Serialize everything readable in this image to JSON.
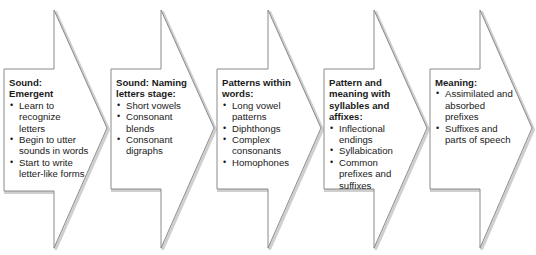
{
  "diagram": {
    "type": "chevron-process",
    "direction": "left-to-right",
    "colors": {
      "fill": "#ffffff",
      "stroke": "#8a8a8a",
      "shadow": "#c8c8c8",
      "text": "#1a1a1a"
    },
    "stages": [
      {
        "title": "Sound: Emergent",
        "title_lines": [
          "Sound:",
          "Emergent"
        ],
        "items": [
          "Learn to recognize letters",
          "Begin to utter sounds in words",
          "Start to write letter-like forms"
        ]
      },
      {
        "title": "Sound: Naming letters stage:",
        "title_lines": [
          "Sound: Naming",
          "letters stage:"
        ],
        "items": [
          "Short vowels",
          "Consonant blends",
          "Consonant digraphs"
        ]
      },
      {
        "title": "Patterns within words:",
        "title_lines": [
          "Patterns within",
          "words:"
        ],
        "items": [
          "Long vowel patterns",
          "Diphthongs",
          "Complex consonants",
          "Homophones"
        ]
      },
      {
        "title": "Pattern and meaning with syllables and affixes:",
        "title_lines": [
          "Pattern and",
          "meaning with",
          "syllables and",
          "affixes:"
        ],
        "items": [
          "Inflectional endings",
          "Syllabication",
          "Common prefixes and suffixes"
        ]
      },
      {
        "title": "Meaning:",
        "title_lines": [
          "Meaning:"
        ],
        "items": [
          "Assimilated and absorbed prefixes",
          "Suffixes and parts of speech"
        ]
      }
    ]
  }
}
